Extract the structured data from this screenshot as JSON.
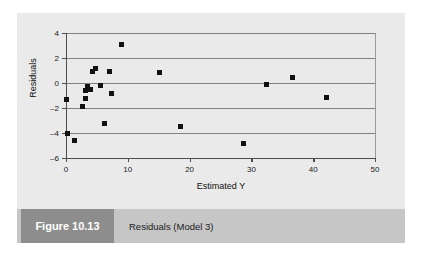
{
  "figure": {
    "tag_label": "Figure 10.13",
    "caption": "Residuals (Model 3)",
    "tag_bg_color": "#8d8d8d",
    "caption_bg_color": "#c6c6c6",
    "panel_bg_color": "#eaeaea"
  },
  "chart_data": {
    "type": "scatter",
    "title": "",
    "xlabel": "Estimated Y",
    "ylabel": "Residuals",
    "xlim": [
      0,
      50
    ],
    "ylim": [
      -6,
      4
    ],
    "xticks": [
      0,
      10,
      20,
      30,
      40,
      50
    ],
    "yticks": [
      4,
      2,
      0,
      -2,
      -4,
      -6
    ],
    "xtick_labels": [
      "0",
      "10",
      "20",
      "30",
      "40",
      "50"
    ],
    "ytick_labels": [
      "4",
      "2",
      "0",
      "-2",
      "-4",
      "-6"
    ],
    "grid": "horizontal",
    "grid_color": "#808080",
    "legend": null,
    "marker": {
      "shape": "square",
      "color": "#111111",
      "size_px": 5
    },
    "series": [
      {
        "name": "Residuals",
        "points": [
          [
            0.0,
            -1.3
          ],
          [
            0.3,
            -4.0
          ],
          [
            1.3,
            -4.6
          ],
          [
            2.6,
            -1.9
          ],
          [
            3.1,
            -1.2
          ],
          [
            3.4,
            -0.3
          ],
          [
            3.2,
            -0.6
          ],
          [
            3.9,
            -0.5
          ],
          [
            4.3,
            0.9
          ],
          [
            4.8,
            1.2
          ],
          [
            5.6,
            -0.2
          ],
          [
            6.3,
            -3.2
          ],
          [
            7.1,
            0.9
          ],
          [
            7.4,
            -0.85
          ],
          [
            8.9,
            3.1
          ],
          [
            15.2,
            0.85
          ],
          [
            18.6,
            -3.5
          ],
          [
            28.8,
            -4.8
          ],
          [
            32.4,
            -0.15
          ],
          [
            36.6,
            0.45
          ],
          [
            42.2,
            -1.15
          ]
        ]
      }
    ]
  }
}
